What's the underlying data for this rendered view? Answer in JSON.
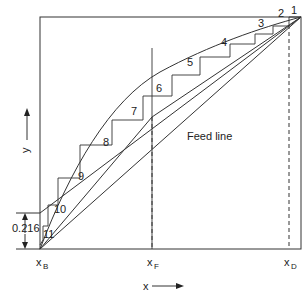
{
  "diagram": {
    "type": "McCabe-Thiele staircase diagram",
    "axes": {
      "x_label": "x",
      "y_label": "y",
      "x_ticks": [
        {
          "label": "x",
          "sub": "B"
        },
        {
          "label": "x",
          "sub": "F"
        },
        {
          "label": "x",
          "sub": "D"
        }
      ]
    },
    "feed_line_label": "Feed line",
    "intercept_label": "0.216",
    "stage_labels": [
      "1",
      "2",
      "3",
      "4",
      "5",
      "6",
      "7",
      "8",
      "9",
      "10",
      "11"
    ],
    "colors": {
      "line": "#222222",
      "background": "#ffffff"
    }
  }
}
